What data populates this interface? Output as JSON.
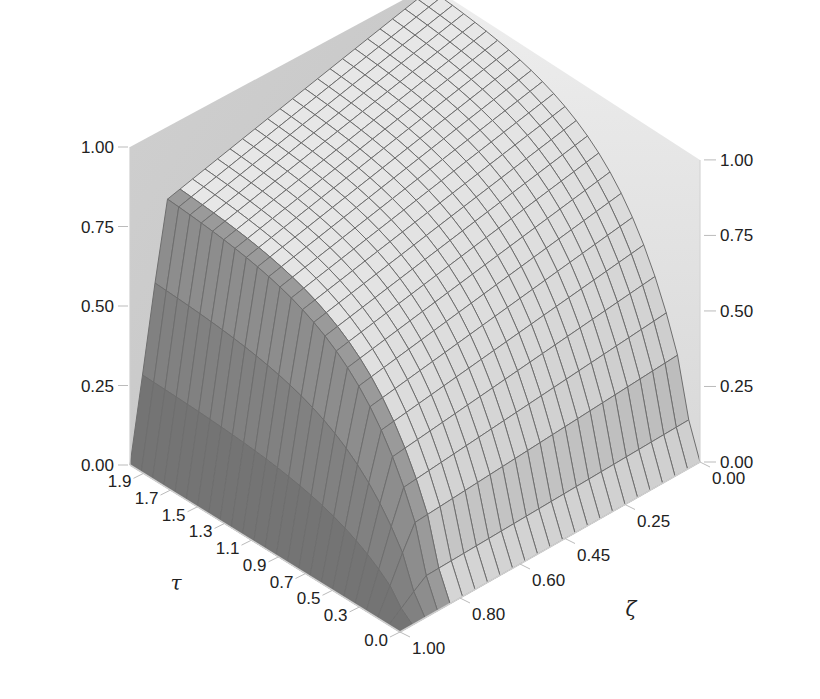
{
  "chart_data": {
    "type": "surface3d",
    "title": "",
    "zlabel": "ψ",
    "xlabel": "τ",
    "ylabel": "ζ",
    "z_ticks_left": [
      "0.00",
      "0.25",
      "0.50",
      "0.75",
      "1.00"
    ],
    "z_ticks_right": [
      "0.00",
      "0.25",
      "0.50",
      "0.75",
      "1.00"
    ],
    "tau_ticks": [
      "0.0",
      "0.3",
      "0.5",
      "0.7",
      "0.9",
      "1.1",
      "1.3",
      "1.5",
      "1.7",
      "1.9"
    ],
    "zeta_ticks": [
      "0.00",
      "0.25",
      "0.45",
      "0.60",
      "0.80",
      "1.00"
    ],
    "tau_range": [
      0.0,
      2.0
    ],
    "zeta_range": [
      0.0,
      1.0
    ],
    "z_range": [
      0.0,
      1.0
    ],
    "surface_description": "psi rises with tau and is near 1 at small zeta; drops sharply to 0 as zeta approaches 1 and as tau approaches 0",
    "corner_values": {
      "tau_max_zeta_0": 1.0,
      "tau_max_zeta_1": 0.75,
      "tau_0_zeta_0": 0.0,
      "tau_0_zeta_1": 0.0
    },
    "grid_resolution": 24,
    "colors": {
      "wall": "#c8c8c8",
      "surface_light": "#f2f2f2",
      "surface_dark": "#5a5a5a",
      "mesh": "#6e6e6e"
    }
  }
}
